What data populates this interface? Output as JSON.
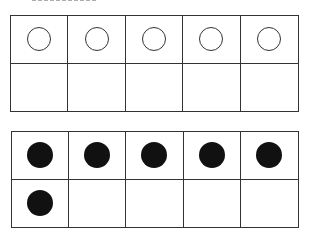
{
  "figure": {
    "type": "ten-frames",
    "frames": [
      {
        "name": "top-ten-frame",
        "rows": 2,
        "columns": 5,
        "counter_style": "empty",
        "cells": [
          "empty",
          "empty",
          "empty",
          "empty",
          "empty",
          "none",
          "none",
          "none",
          "none",
          "none"
        ],
        "count": 5
      },
      {
        "name": "bottom-ten-frame",
        "rows": 2,
        "columns": 5,
        "counter_style": "filled",
        "cells": [
          "filled",
          "filled",
          "filled",
          "filled",
          "filled",
          "filled",
          "none",
          "none",
          "none",
          "none"
        ],
        "count": 6
      }
    ]
  }
}
